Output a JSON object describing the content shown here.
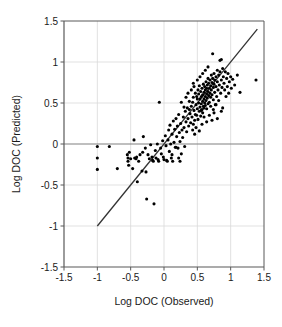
{
  "chart_data": {
    "type": "scatter",
    "title": "",
    "xlabel": "Log DOC (Observed)",
    "ylabel": "Log DOC (Predicted)",
    "xlim": [
      -1.5,
      1.5
    ],
    "ylim": [
      -1.5,
      1.5
    ],
    "xticks": [
      -1.5,
      -1,
      -0.5,
      0,
      0.5,
      1,
      1.5
    ],
    "xticklabels": [
      "-1.5",
      "-1",
      "-0.5",
      "0",
      "0.5",
      "1",
      "1.5"
    ],
    "yticks": [
      -1.5,
      -1,
      -0.5,
      0,
      0.5,
      1,
      1.5
    ],
    "yticklabels": [
      "-1.5",
      "-1",
      "-0.5",
      "0",
      "0.5",
      "1",
      "1.5"
    ],
    "grid": true,
    "grid_color": "#d9d9d9",
    "zero_line_color": "#808080",
    "frame_color": "#595959",
    "marker_color": "#000000",
    "marker_size": 3.1,
    "legend": null,
    "annotations": [],
    "series": [
      {
        "name": "observations",
        "marker": "filled-circle",
        "points": [
          [
            -1.0,
            -0.03
          ],
          [
            -1.0,
            -0.17
          ],
          [
            -1.0,
            -0.31
          ],
          [
            -0.82,
            -0.03
          ],
          [
            -0.7,
            -0.3
          ],
          [
            -0.55,
            -0.13
          ],
          [
            -0.54,
            -0.17
          ],
          [
            -0.54,
            -0.21
          ],
          [
            -0.53,
            -0.26
          ],
          [
            -0.52,
            -0.1
          ],
          [
            -0.5,
            -0.18
          ],
          [
            -0.47,
            -0.3
          ],
          [
            -0.45,
            0.05
          ],
          [
            -0.44,
            -0.17
          ],
          [
            -0.42,
            -0.18
          ],
          [
            -0.41,
            -0.16
          ],
          [
            -0.4,
            -0.46
          ],
          [
            -0.38,
            -0.21
          ],
          [
            -0.36,
            -0.13
          ],
          [
            -0.33,
            -0.33
          ],
          [
            -0.32,
            -0.1
          ],
          [
            -0.31,
            0.09
          ],
          [
            -0.28,
            -0.05
          ],
          [
            -0.27,
            -0.34
          ],
          [
            -0.26,
            -0.67
          ],
          [
            -0.24,
            -0.13
          ],
          [
            -0.22,
            -0.18
          ],
          [
            -0.2,
            -0.01
          ],
          [
            -0.18,
            -0.16
          ],
          [
            -0.17,
            -0.2
          ],
          [
            -0.16,
            -0.21
          ],
          [
            -0.15,
            -0.73
          ],
          [
            -0.13,
            -0.08
          ],
          [
            -0.12,
            -0.17
          ],
          [
            -0.1,
            0.0
          ],
          [
            -0.09,
            -0.19
          ],
          [
            -0.08,
            -0.21
          ],
          [
            -0.07,
            0.51
          ],
          [
            -0.05,
            -0.05
          ],
          [
            -0.04,
            -0.12
          ],
          [
            -0.02,
            0.04
          ],
          [
            -0.01,
            -0.16
          ],
          [
            0.0,
            -0.19
          ],
          [
            0.02,
            0.1
          ],
          [
            0.03,
            -0.02
          ],
          [
            0.04,
            -0.2
          ],
          [
            0.06,
            0.05
          ],
          [
            0.07,
            0.17
          ],
          [
            0.08,
            -0.09
          ],
          [
            0.09,
            0.23
          ],
          [
            0.1,
            0.0
          ],
          [
            0.11,
            -0.17
          ],
          [
            0.12,
            0.12
          ],
          [
            0.13,
            -0.21
          ],
          [
            0.14,
            0.28
          ],
          [
            0.15,
            0.02
          ],
          [
            0.16,
            0.18
          ],
          [
            0.17,
            -0.04
          ],
          [
            0.18,
            0.31
          ],
          [
            0.19,
            0.09
          ],
          [
            0.2,
            0.22
          ],
          [
            0.21,
            -0.05
          ],
          [
            0.22,
            0.36
          ],
          [
            0.23,
            0.14
          ],
          [
            0.24,
            0.03
          ],
          [
            0.25,
            0.25
          ],
          [
            0.26,
            0.51
          ],
          [
            0.27,
            0.17
          ],
          [
            0.28,
            0.08
          ],
          [
            0.29,
            0.33
          ],
          [
            0.3,
            0.2
          ],
          [
            0.31,
            -0.03
          ],
          [
            0.32,
            0.4
          ],
          [
            0.33,
            0.27
          ],
          [
            0.34,
            0.15
          ],
          [
            0.35,
            0.44
          ],
          [
            0.36,
            0.31
          ],
          [
            0.37,
            0.22
          ],
          [
            0.38,
            0.52
          ],
          [
            0.39,
            0.37
          ],
          [
            0.4,
            0.26
          ],
          [
            0.41,
            0.46
          ],
          [
            0.42,
            0.33
          ],
          [
            0.43,
            0.17
          ],
          [
            0.44,
            0.57
          ],
          [
            0.45,
            0.41
          ],
          [
            0.46,
            0.29
          ],
          [
            0.47,
            0.62
          ],
          [
            0.48,
            0.48
          ],
          [
            0.49,
            0.35
          ],
          [
            0.5,
            0.55
          ],
          [
            0.5,
            0.43
          ],
          [
            0.51,
            0.66
          ],
          [
            0.51,
            0.3
          ],
          [
            0.52,
            0.5
          ],
          [
            0.52,
            0.61
          ],
          [
            0.53,
            0.4
          ],
          [
            0.53,
            0.71
          ],
          [
            0.54,
            0.55
          ],
          [
            0.54,
            0.45
          ],
          [
            0.55,
            0.64
          ],
          [
            0.55,
            0.34
          ],
          [
            0.56,
            0.58
          ],
          [
            0.56,
            0.49
          ],
          [
            0.57,
            0.68
          ],
          [
            0.57,
            0.42
          ],
          [
            0.58,
            0.6
          ],
          [
            0.58,
            0.52
          ],
          [
            0.59,
            0.73
          ],
          [
            0.59,
            0.46
          ],
          [
            0.6,
            0.63
          ],
          [
            0.6,
            0.55
          ],
          [
            0.61,
            0.7
          ],
          [
            0.61,
            0.5
          ],
          [
            0.62,
            0.66
          ],
          [
            0.62,
            0.58
          ],
          [
            0.63,
            0.76
          ],
          [
            0.63,
            0.53
          ],
          [
            0.64,
            0.68
          ],
          [
            0.64,
            0.61
          ],
          [
            0.65,
            0.72
          ],
          [
            0.65,
            0.56
          ],
          [
            0.66,
            0.8
          ],
          [
            0.66,
            0.64
          ],
          [
            0.67,
            0.59
          ],
          [
            0.67,
            0.74
          ],
          [
            0.68,
            0.68
          ],
          [
            0.68,
            0.51
          ],
          [
            0.69,
            0.78
          ],
          [
            0.69,
            0.62
          ],
          [
            0.7,
            0.71
          ],
          [
            0.7,
            0.57
          ],
          [
            0.71,
            0.84
          ],
          [
            0.71,
            0.66
          ],
          [
            0.72,
            0.75
          ],
          [
            0.72,
            0.6
          ],
          [
            0.73,
            1.1
          ],
          [
            0.73,
            0.8
          ],
          [
            0.74,
            0.69
          ],
          [
            0.74,
            0.54
          ],
          [
            0.75,
            0.86
          ],
          [
            0.75,
            0.73
          ],
          [
            0.76,
            0.63
          ],
          [
            0.76,
            0.78
          ],
          [
            0.77,
            0.48
          ],
          [
            0.78,
            0.82
          ],
          [
            0.78,
            0.7
          ],
          [
            0.79,
            0.58
          ],
          [
            0.8,
            0.9
          ],
          [
            0.8,
            0.76
          ],
          [
            0.81,
            0.66
          ],
          [
            0.82,
            0.84
          ],
          [
            0.82,
            0.53
          ],
          [
            0.83,
            0.72
          ],
          [
            0.84,
            1.02
          ],
          [
            0.84,
            0.88
          ],
          [
            0.85,
            0.62
          ],
          [
            0.86,
            1.03
          ],
          [
            0.86,
            0.78
          ],
          [
            0.87,
            0.69
          ],
          [
            0.88,
            0.92
          ],
          [
            0.88,
            0.44
          ],
          [
            0.89,
            0.82
          ],
          [
            0.9,
            0.74
          ],
          [
            0.91,
            0.66
          ],
          [
            0.92,
            0.88
          ],
          [
            0.93,
            0.58
          ],
          [
            0.94,
            0.8
          ],
          [
            0.95,
            0.7
          ],
          [
            0.96,
            0.86
          ],
          [
            0.97,
            0.62
          ],
          [
            0.98,
            0.76
          ],
          [
            1.0,
            0.82
          ],
          [
            1.01,
            0.68
          ],
          [
            1.03,
            0.79
          ],
          [
            1.06,
            0.72
          ],
          [
            1.1,
            0.84
          ],
          [
            1.14,
            0.63
          ],
          [
            1.38,
            0.78
          ],
          [
            0.3,
            0.45
          ],
          [
            0.33,
            0.57
          ],
          [
            0.36,
            0.62
          ],
          [
            0.38,
            0.42
          ],
          [
            0.41,
            0.66
          ],
          [
            0.43,
            0.51
          ],
          [
            0.45,
            0.7
          ],
          [
            0.47,
            0.36
          ],
          [
            0.49,
            0.58
          ],
          [
            0.44,
            0.24
          ],
          [
            0.46,
            0.12
          ],
          [
            0.48,
            0.2
          ],
          [
            0.53,
            0.16
          ],
          [
            0.57,
            0.24
          ],
          [
            0.6,
            0.33
          ],
          [
            0.64,
            0.27
          ],
          [
            0.68,
            0.35
          ],
          [
            0.72,
            0.29
          ],
          [
            0.75,
            0.38
          ],
          [
            0.8,
            0.31
          ],
          [
            0.86,
            0.4
          ],
          [
            0.22,
            -0.17
          ],
          [
            0.24,
            -0.21
          ],
          [
            0.26,
            -0.12
          ],
          [
            0.18,
            -0.04
          ],
          [
            0.12,
            -0.13
          ],
          [
            0.05,
            -0.21
          ],
          [
            0.6,
            0.44
          ],
          [
            0.62,
            0.47
          ],
          [
            0.64,
            0.43
          ],
          [
            0.66,
            0.49
          ],
          [
            0.58,
            0.38
          ],
          [
            0.56,
            0.41
          ],
          [
            0.7,
            0.46
          ],
          [
            0.74,
            0.42
          ],
          [
            0.78,
            0.48
          ],
          [
            0.5,
            0.78
          ],
          [
            0.54,
            0.82
          ],
          [
            0.58,
            0.86
          ],
          [
            0.62,
            0.9
          ],
          [
            0.66,
            0.94
          ],
          [
            0.44,
            0.74
          ]
        ]
      }
    ],
    "fit_line": {
      "name": "regression-line",
      "x0": -1.0,
      "y0": -1.0,
      "x1": 1.4,
      "y1": 1.4,
      "color": "#333333",
      "width": 1.3
    }
  }
}
